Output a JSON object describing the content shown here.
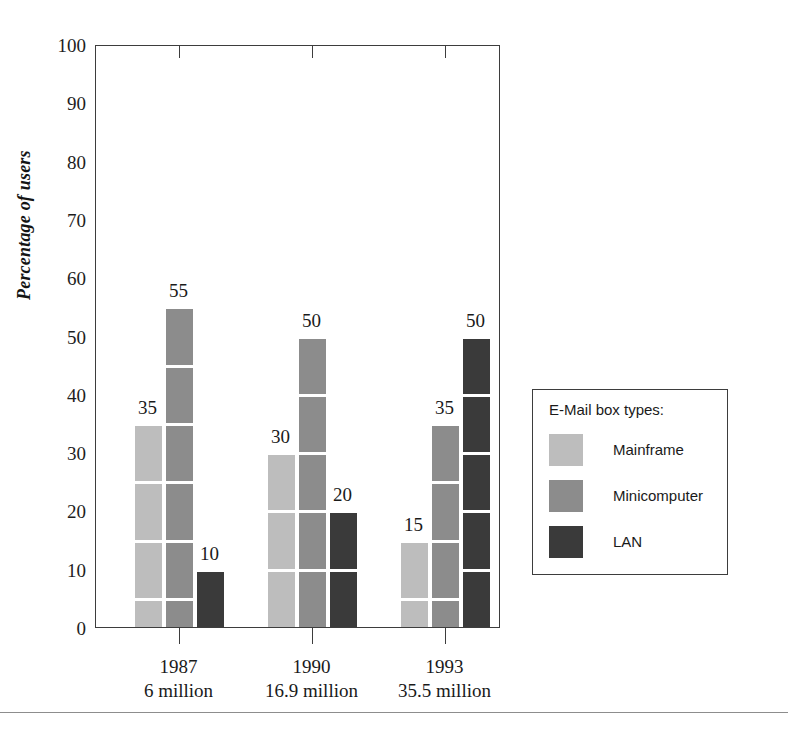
{
  "chart_data": {
    "type": "bar",
    "title": "",
    "subtitle": "",
    "xlabel": "",
    "ylabel": "Percentage of users",
    "ylim": [
      0,
      100
    ],
    "ytick_values": [
      0,
      10,
      20,
      30,
      40,
      50,
      60,
      70,
      80,
      90,
      100
    ],
    "ytick_labels": [
      "0",
      "10",
      "20",
      "30",
      "40",
      "50",
      "60",
      "70",
      "80",
      "90",
      "100"
    ],
    "grid": false,
    "legend_position": "right",
    "legend_title": "E-Mail box types:",
    "bar_style": "segmented-blocks-of-10",
    "categories": [
      "1987",
      "1990",
      "1993"
    ],
    "category_sublabels": [
      "6 million",
      "16.9 million",
      "35.5 million"
    ],
    "xtick_labels": [
      "1987\n6 million",
      "1990\n16.9 million",
      "1993\n35.5 million"
    ],
    "series": [
      {
        "name": "Mainframe",
        "color": "#bdbdbd",
        "values": [
          35,
          30,
          15
        ],
        "data_labels": [
          "35",
          "30",
          "15"
        ]
      },
      {
        "name": "Minicomputer",
        "color": "#8c8c8c",
        "values": [
          55,
          50,
          35
        ],
        "data_labels": [
          "55",
          "50",
          "35"
        ]
      },
      {
        "name": "LAN",
        "color": "#3a3a3a",
        "values": [
          10,
          20,
          50
        ],
        "data_labels": [
          "10",
          "20",
          "50"
        ]
      }
    ],
    "annotations": []
  },
  "legend": {
    "title": "E-Mail box types:",
    "items": [
      {
        "label": "Mainframe",
        "color": "#bdbdbd"
      },
      {
        "label": "Minicomputer",
        "color": "#8c8c8c"
      },
      {
        "label": "LAN",
        "color": "#3a3a3a"
      }
    ]
  },
  "axes": {
    "y_label": "Percentage of users",
    "y_ticks": [
      "100",
      "90",
      "80",
      "70",
      "60",
      "50",
      "40",
      "30",
      "20",
      "10",
      "0"
    ],
    "x_groups": [
      {
        "year": "1987",
        "users": "6 million"
      },
      {
        "year": "1990",
        "users": "16.9 million"
      },
      {
        "year": "1993",
        "users": "35.5 million"
      }
    ]
  },
  "footer": {
    "text": ""
  },
  "colors": {
    "mainframe": "#bdbdbd",
    "minicomputer": "#8c8c8c",
    "lan": "#3a3a3a",
    "axis": "#3d3d3d",
    "text": "#1a1a1a",
    "background": "#ffffff"
  }
}
